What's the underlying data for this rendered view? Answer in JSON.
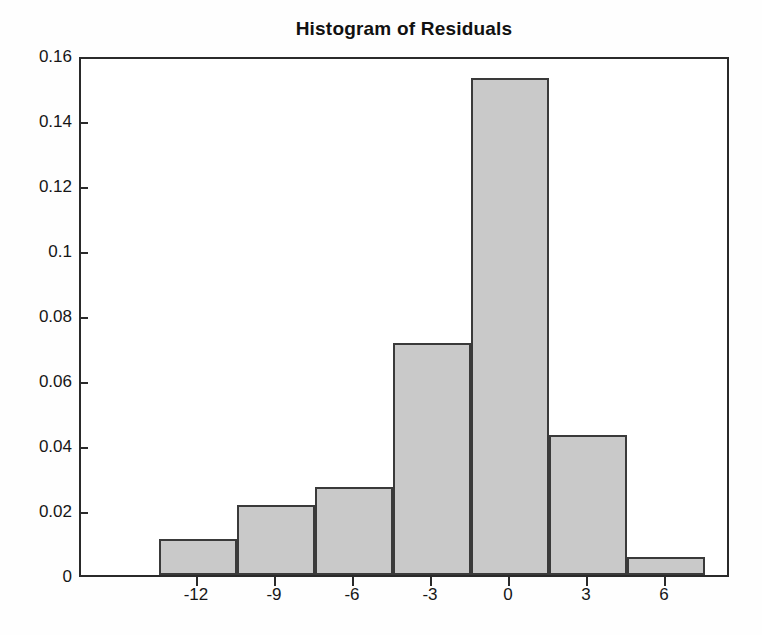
{
  "chart_data": {
    "type": "bar",
    "title": "Histogram of Residuals",
    "xlabel": "",
    "ylabel": "",
    "grid": false,
    "legend": "none",
    "bin_width": 3,
    "bin_edges": [
      -13.5,
      -10.5,
      -7.5,
      -4.5,
      -1.5,
      1.5,
      4.5,
      7.5
    ],
    "categories": [
      "-13.5 to -10.5",
      "-10.5 to -7.5",
      "-7.5 to -4.5",
      "-4.5 to -1.5",
      "-1.5 to 1.5",
      "1.5 to 4.5",
      "4.5 to 7.5"
    ],
    "bin_centers": [
      -12,
      -9,
      -6,
      -3,
      0,
      3,
      6
    ],
    "values": [
      0.011,
      0.0216,
      0.0271,
      0.0713,
      0.1528,
      0.0432,
      0.0054
    ],
    "xlim": [
      -16.5,
      8.5
    ],
    "ylim": [
      0,
      0.16
    ],
    "xticks": [
      -12,
      -9,
      -6,
      -3,
      0,
      3,
      6
    ],
    "xtick_labels": [
      "-12",
      "-9",
      "-6",
      "-3",
      "0",
      "3",
      "6"
    ],
    "yticks": [
      0,
      0.02,
      0.04,
      0.06,
      0.08,
      0.1,
      0.12,
      0.14,
      0.16
    ],
    "ytick_labels": [
      "0",
      "0.02",
      "0.04",
      "0.06",
      "0.08",
      "0.1",
      "0.12",
      "0.14",
      "0.16"
    ],
    "bar_fill_color": "#c9c9c9",
    "bar_edge_color": "#3a3a3a",
    "axis_color": "#2a2a2a",
    "background_color": "#ffffff"
  }
}
